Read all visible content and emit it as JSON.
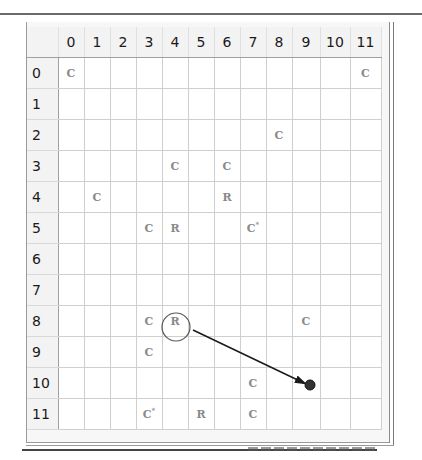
{
  "grid": {
    "column_headers": [
      "0",
      "1",
      "2",
      "3",
      "4",
      "5",
      "6",
      "7",
      "8",
      "9",
      "10",
      "11"
    ],
    "row_headers": [
      "0",
      "1",
      "2",
      "3",
      "4",
      "5",
      "6",
      "7",
      "8",
      "9",
      "10",
      "11"
    ],
    "column_widths": [
      31,
      26,
      26,
      26,
      26,
      26,
      26,
      26,
      26,
      26,
      28,
      30,
      31
    ],
    "cells": [
      [
        "C",
        "",
        "",
        "",
        "",
        "",
        "",
        "",
        "",
        "",
        "",
        "C"
      ],
      [
        "",
        "",
        "",
        "",
        "",
        "",
        "",
        "",
        "",
        "",
        "",
        ""
      ],
      [
        "",
        "",
        "",
        "",
        "",
        "",
        "",
        "",
        "C",
        "",
        "",
        ""
      ],
      [
        "",
        "",
        "",
        "",
        "C",
        "",
        "C",
        "",
        "",
        "",
        "",
        ""
      ],
      [
        "",
        "C",
        "",
        "",
        "",
        "",
        "R",
        "",
        "",
        "",
        "",
        ""
      ],
      [
        "",
        "",
        "",
        "C",
        "R",
        "",
        "",
        "C*",
        "",
        "",
        "",
        ""
      ],
      [
        "",
        "",
        "",
        "",
        "",
        "",
        "",
        "",
        "",
        "",
        "",
        ""
      ],
      [
        "",
        "",
        "",
        "",
        "",
        "",
        "",
        "",
        "",
        "",
        "",
        ""
      ],
      [
        "",
        "",
        "",
        "C",
        "R",
        "",
        "",
        "",
        "",
        "C",
        "",
        ""
      ],
      [
        "",
        "",
        "",
        "C",
        "",
        "",
        "",
        "",
        "",
        "",
        "",
        ""
      ],
      [
        "",
        "",
        "",
        "",
        "",
        "",
        "",
        "C",
        "",
        "",
        "",
        ""
      ],
      [
        "",
        "",
        "",
        "C*",
        "",
        "R",
        "",
        "C",
        "",
        "",
        "",
        ""
      ]
    ]
  },
  "annotations": {
    "selected_cell": {
      "row": 8,
      "col": 4,
      "label": "R"
    },
    "target_cell": {
      "row": 10,
      "col": 9
    },
    "arrow": {
      "from": [
        193,
        330
      ],
      "to": [
        304,
        383
      ]
    },
    "circle": {
      "cx": 176,
      "cy": 327,
      "r": 14
    },
    "dot": {
      "cx": 310,
      "cy": 385,
      "r": 5
    }
  },
  "colors": {
    "piece_text": "#8a8a8a",
    "arrow": "#1a1a1a",
    "dot": "#333333",
    "grid_line": "#cfcfcf",
    "header_bg": "#f3f3f3"
  }
}
